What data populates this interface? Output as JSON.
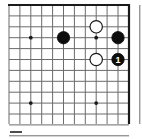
{
  "diagram": {
    "kind": "go-board-diagram",
    "board": {
      "columns": 12,
      "rows": 12,
      "left": 9,
      "top": 5,
      "right": 129,
      "bottom": 124,
      "spacing": 10.9,
      "line_color": "#6b6b6b",
      "edge_color": "#1a1a1a",
      "background_color": "#ffffff",
      "edge_sides": [
        "top",
        "right"
      ]
    },
    "star_points": [
      {
        "name": "star-point-left-upper",
        "col": 2,
        "row": 3
      },
      {
        "name": "star-point-left-lower",
        "col": 2,
        "row": 9
      },
      {
        "name": "star-point-right-upper",
        "col": 8,
        "row": 3
      },
      {
        "name": "star-point-right-lower",
        "col": 8,
        "row": 9
      }
    ],
    "star_point_color": "#1a1a1a",
    "star_point_radius": 1.9,
    "stones": [
      {
        "name": "black-stone-left",
        "color": "black",
        "col": 5,
        "row": 3,
        "label": "",
        "fill": "#0d0d0d",
        "stroke": "#0d0d0d",
        "label_color": "#ffffff"
      },
      {
        "name": "white-stone-upper",
        "color": "white",
        "col": 8,
        "row": 2,
        "label": "",
        "fill": "#ffffff",
        "stroke": "#1a1a1a",
        "label_color": "#1a1a1a"
      },
      {
        "name": "black-stone-right",
        "color": "black",
        "col": 10,
        "row": 3,
        "label": "",
        "fill": "#0d0d0d",
        "stroke": "#0d0d0d",
        "label_color": "#ffffff"
      },
      {
        "name": "white-stone-lower",
        "color": "white",
        "col": 8,
        "row": 5,
        "label": "",
        "fill": "#ffffff",
        "stroke": "#1a1a1a",
        "label_color": "#1a1a1a"
      },
      {
        "name": "black-stone-move-1",
        "color": "black",
        "col": 10,
        "row": 5,
        "label": "1",
        "fill": "#0d0d0d",
        "stroke": "#0d0d0d",
        "label_color": "#ffffff"
      }
    ],
    "stone_radius": 6.2,
    "caption_mark": {
      "name": "caption-dash",
      "text": "",
      "color": "#4d4d4d",
      "x": 10,
      "y": 131,
      "width": 12,
      "height": 2
    }
  }
}
